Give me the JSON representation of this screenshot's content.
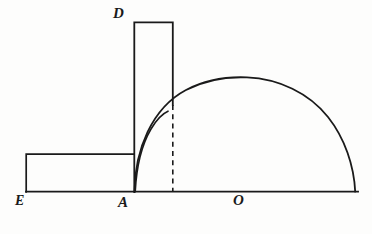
{
  "figure": {
    "background_color": "#fdfdfc",
    "ink_color": "#1a1a1a",
    "stroke_width": 1.6,
    "labels": {
      "E": "E",
      "A": "A",
      "O": "O",
      "D": "D"
    },
    "label_positions": {
      "E": {
        "x": 15,
        "y": 194
      },
      "A": {
        "x": 118,
        "y": 195
      },
      "O": {
        "x": 233,
        "y": 193
      },
      "D": {
        "x": 113,
        "y": 6
      }
    },
    "geometry": {
      "baseline": {
        "x1": 26,
        "y1": 192,
        "x2": 358,
        "y2": 192
      },
      "left_rectangle": {
        "x": 26,
        "y": 154,
        "width": 108,
        "height": 38
      },
      "tall_rectangle": {
        "x": 134,
        "y": 22,
        "width": 39,
        "height": 170
      },
      "dashed_segment": {
        "x": 173,
        "y1": 105,
        "y2": 192
      },
      "dome_arc": {
        "left_foot_x": 134,
        "right_foot_x": 355,
        "apex_x": 245,
        "apex_y": 77,
        "baseline_y": 192
      },
      "inner_arc": {
        "start_x": 135,
        "start_y": 192,
        "end_x": 168,
        "end_y": 111
      }
    }
  }
}
